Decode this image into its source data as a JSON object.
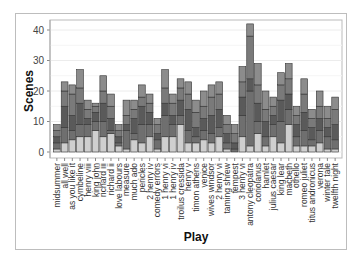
{
  "chart_data": {
    "type": "bar",
    "stacked": true,
    "title": "",
    "xlabel": "Play",
    "ylabel": "Scenes",
    "ylim": [
      0,
      44
    ],
    "yticks": [
      0,
      10,
      20,
      30,
      40
    ],
    "grid": true,
    "legend": "none",
    "categories": [
      "midsummer",
      "all well",
      "as you like it",
      "cymbeline",
      "henry viii",
      "king john",
      "richard iii",
      "richard ii",
      "love labours",
      "measure",
      "much ado",
      "pericles",
      "2 henry iv",
      "comedy errors",
      "1 henry vi",
      "1 henry iv",
      "troilus cressida",
      "henry v",
      "timon athens",
      "venice",
      "wives windsor",
      "2 henry vi",
      "taming shrew",
      "tempest",
      "3 henry vi",
      "antony cleopatra",
      "coriolanus",
      "hamlet",
      "julius caesar",
      "king lear",
      "macbeth",
      "othello",
      "romeo juliet",
      "titus andronicus",
      "verona",
      "winter tale",
      "twelfth night"
    ],
    "totals": [
      9,
      23,
      22,
      27,
      17,
      16,
      25,
      19,
      9,
      17,
      17,
      22,
      19,
      11,
      27,
      19,
      24,
      23,
      17,
      20,
      22,
      23,
      12,
      9,
      28,
      42,
      29,
      20,
      18,
      26,
      29,
      15,
      24,
      14,
      20,
      15,
      18
    ],
    "series": [
      {
        "name": "Act 1",
        "values": [
          1,
          3,
          4,
          5,
          5,
          7,
          5,
          6,
          2,
          1,
          4,
          3,
          5,
          1,
          5,
          5,
          9,
          3,
          3,
          4,
          3,
          5,
          1,
          0,
          5,
          2,
          6,
          2,
          5,
          3,
          9,
          2,
          2,
          2,
          3,
          1,
          1
        ]
      },
      {
        "name": "Act 2",
        "values": [
          2,
          5,
          3,
          4,
          4,
          3,
          5,
          1,
          1,
          6,
          2,
          6,
          4,
          3,
          7,
          4,
          3,
          4,
          2,
          3,
          3,
          3,
          2,
          1,
          7,
          18,
          4,
          3,
          4,
          7,
          5,
          3,
          5,
          2,
          4,
          4,
          3
        ]
      },
      {
        "name": "Act 3",
        "values": [
          2,
          7,
          5,
          7,
          2,
          3,
          6,
          4,
          2,
          2,
          5,
          6,
          4,
          2,
          4,
          3,
          5,
          7,
          3,
          4,
          6,
          6,
          3,
          2,
          6,
          4,
          6,
          5,
          3,
          7,
          5,
          4,
          6,
          4,
          4,
          3,
          5
        ]
      },
      {
        "name": "Act 4",
        "values": [
          2,
          5,
          7,
          5,
          3,
          2,
          4,
          4,
          2,
          3,
          3,
          3,
          3,
          3,
          5,
          4,
          4,
          5,
          5,
          4,
          6,
          5,
          3,
          3,
          5,
          14,
          6,
          4,
          3,
          5,
          5,
          3,
          6,
          3,
          4,
          3,
          5
        ]
      },
      {
        "name": "Act 5",
        "values": [
          2,
          3,
          3,
          6,
          3,
          1,
          5,
          4,
          2,
          5,
          3,
          4,
          3,
          2,
          6,
          3,
          3,
          4,
          4,
          5,
          4,
          4,
          3,
          3,
          5,
          4,
          7,
          6,
          3,
          4,
          5,
          3,
          5,
          3,
          5,
          4,
          4
        ]
      }
    ],
    "colors": [
      "#cfcfcf",
      "#6f6f6f",
      "#5a5a5a",
      "#7a7a7a",
      "#8c8c8c"
    ]
  }
}
